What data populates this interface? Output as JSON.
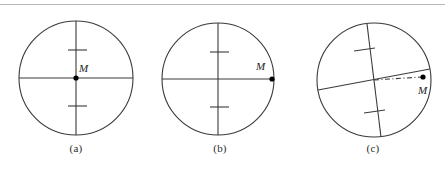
{
  "figure": {
    "width": 445,
    "height": 172,
    "background_color": "#ffffff",
    "rule_color": "#b9b9bd",
    "stroke_color": "#3a3a3a",
    "point_color": "#000000"
  },
  "panels": [
    {
      "id": "a",
      "caption": "(a)",
      "point_label": "M",
      "circle": {
        "cx": 76,
        "cy": 78,
        "r": 57
      },
      "point": {
        "x": 76,
        "y": 78
      },
      "lines": [
        {
          "name": "horizontal-diameter",
          "x1": 19,
          "y1": 78,
          "x2": 133,
          "y2": 78
        },
        {
          "name": "vertical-diameter",
          "x1": 76,
          "y1": 21,
          "x2": 76,
          "y2": 135
        }
      ],
      "ticks": [
        {
          "name": "upper-tick",
          "x1": 68,
          "y1": 50,
          "x2": 87,
          "y2": 50
        },
        {
          "name": "lower-tick",
          "x1": 68,
          "y1": 106,
          "x2": 87,
          "y2": 106
        }
      ],
      "dash_dot_line": null
    },
    {
      "id": "b",
      "caption": "(b)",
      "point_label": "M",
      "circle": {
        "cx": 218,
        "cy": 79,
        "r": 56
      },
      "point": {
        "x": 272,
        "y": 79
      },
      "lines": [
        {
          "name": "horizontal-diameter",
          "x1": 162,
          "y1": 79,
          "x2": 274,
          "y2": 79
        },
        {
          "name": "vertical-diameter",
          "x1": 218,
          "y1": 23,
          "x2": 218,
          "y2": 135
        }
      ],
      "ticks": [
        {
          "name": "upper-tick",
          "x1": 210,
          "y1": 52,
          "x2": 229,
          "y2": 52
        },
        {
          "name": "lower-tick",
          "x1": 210,
          "y1": 107,
          "x2": 229,
          "y2": 107
        }
      ],
      "dash_dot_line": null
    },
    {
      "id": "c",
      "caption": "(c)",
      "point_label": "M",
      "circle": {
        "cx": 374,
        "cy": 80,
        "r": 57
      },
      "point": {
        "x": 423,
        "y": 77
      },
      "lines": [
        {
          "name": "tilted-chord",
          "x1": 318,
          "y1": 90,
          "x2": 430,
          "y2": 69
        },
        {
          "name": "tilted-diameter",
          "x1": 367,
          "y1": 24,
          "x2": 381,
          "y2": 137
        }
      ],
      "ticks": [
        {
          "name": "upper-tick",
          "x1": 354,
          "y1": 51,
          "x2": 375,
          "y2": 48
        },
        {
          "name": "lower-tick",
          "x1": 364,
          "y1": 113,
          "x2": 385,
          "y2": 110
        }
      ],
      "dash_dot_line": {
        "name": "dash-dot-offset",
        "x1": 374,
        "y1": 80,
        "x2": 422,
        "y2": 77
      }
    }
  ]
}
